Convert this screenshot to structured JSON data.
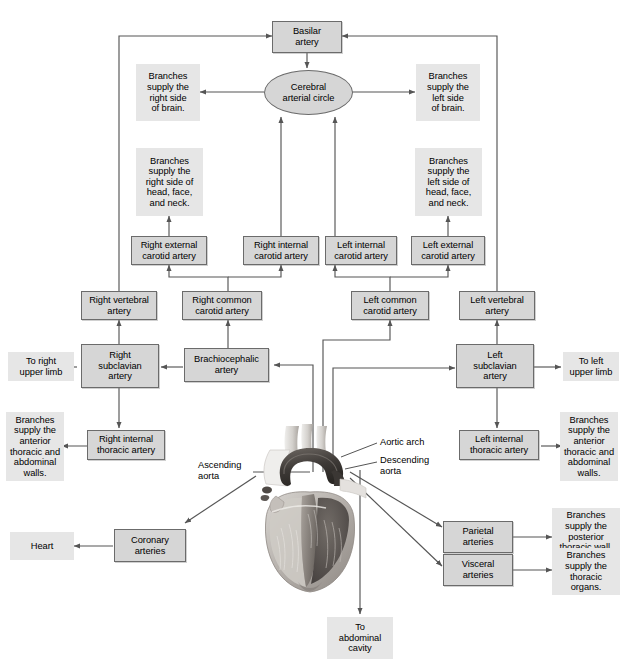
{
  "figure": {
    "type": "flowchart",
    "running_head": ""
  },
  "colors": {
    "box_fill": "#d6d6d6",
    "box_border": "#6b6b6b",
    "flat_fill": "#e6e6e6",
    "connector": "#555555",
    "text": "#000000",
    "page_background": "#ffffff"
  },
  "nodes": {
    "basilar_artery": "Basilar\nartery",
    "cerebral_arterial_circle": "Cerebral\narterial circle",
    "branches_right_brain": "Branches\nsupply the\nright side\nof brain.",
    "branches_left_brain": "Branches\nsupply the\nleft side\nof brain.",
    "branches_right_head": "Branches\nsupply the\nright side of\nhead, face,\nand neck.",
    "branches_left_head": "Branches\nsupply the\nleft side of\nhead, face,\nand neck.",
    "right_external_carotid": "Right external\ncarotid artery",
    "right_internal_carotid": "Right internal\ncarotid artery",
    "left_internal_carotid": "Left internal\ncarotid artery",
    "left_external_carotid": "Left external\ncarotid artery",
    "right_vertebral": "Right vertebral\nartery",
    "right_common_carotid": "Right common\ncarotid artery",
    "left_common_carotid": "Left common\ncarotid artery",
    "left_vertebral": "Left vertebral\nartery",
    "to_right_upper_limb": "To right\nupper limb",
    "right_subclavian": "Right\nsubclavian\nartery",
    "brachiocephalic": "Brachiocephalic\nartery",
    "left_subclavian": "Left\nsubclavian\nartery",
    "to_left_upper_limb": "To left\nupper limb",
    "branches_right_thoracic_walls": "Branches\nsupply the\nanterior\nthoracic and\nabdominal\nwalls.",
    "right_internal_thoracic": "Right internal\nthoracic artery",
    "left_internal_thoracic": "Left internal\nthoracic artery",
    "branches_left_thoracic_walls": "Branches\nsupply the\nanterior\nthoracic and\nabdominal\nwalls.",
    "parietal_arteries": "Parietal\narteries",
    "branches_posterior_wall": "Branches\nsupply the\nposterior\nthoracic wall.",
    "visceral_arteries": "Visceral\narteries",
    "branches_thoracic_organs": "Branches\nsupply the\nthoracic\norgans.",
    "heart": "Heart",
    "coronary_arteries": "Coronary\narteries",
    "to_abdominal_cavity": "To\nabdominal\ncavity"
  },
  "callouts": {
    "ascending_aorta": "Ascending\naorta",
    "aortic_arch": "Aortic arch",
    "descending_aorta": "Descending\naorta"
  },
  "artwork": {
    "heart_illustration": "anatomical cutaway of the human heart with aortic arch, grayscale"
  }
}
